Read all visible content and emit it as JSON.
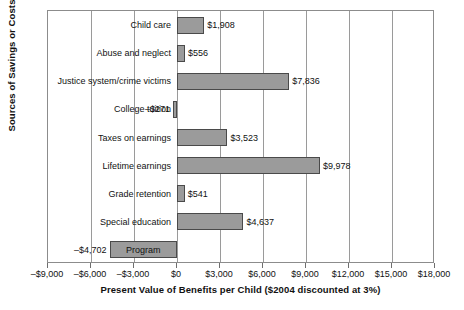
{
  "chart_data": {
    "type": "bar",
    "orientation": "horizontal",
    "title": "",
    "xlabel": "Present Value of Benefits per Child ($2004 discounted at 3%)",
    "ylabel": "Sources of Savings or Costs",
    "xlim": [
      -9000,
      18000
    ],
    "xtick_step": 3000,
    "grid": true,
    "legend": "none",
    "bar_color": "#9b9b9b",
    "bar_border_color": "#4a4a4a",
    "categories": [
      "Child care",
      "Abuse and neglect",
      "Justice system/crime victims",
      "College tuition",
      "Taxes on earnings",
      "Lifetime earnings",
      "Grade retention",
      "Special education",
      "Program"
    ],
    "values": [
      1908,
      556,
      7836,
      -271,
      3523,
      9978,
      541,
      4637,
      -4702
    ],
    "value_labels": [
      "$1,908",
      "$556",
      "$7,836",
      "–$271",
      "$3,523",
      "$9,978",
      "$541",
      "$4,637",
      "–$4,702"
    ],
    "xticks": [
      -9000,
      -6000,
      -3000,
      0,
      3000,
      6000,
      9000,
      12000,
      15000,
      18000
    ],
    "xticklabels": [
      "–$9,000",
      "–$6,000",
      "–$3,000",
      "$0",
      "$3,000",
      "$6,000",
      "$9,000",
      "$12,000",
      "$15,000",
      "$18,000"
    ]
  }
}
